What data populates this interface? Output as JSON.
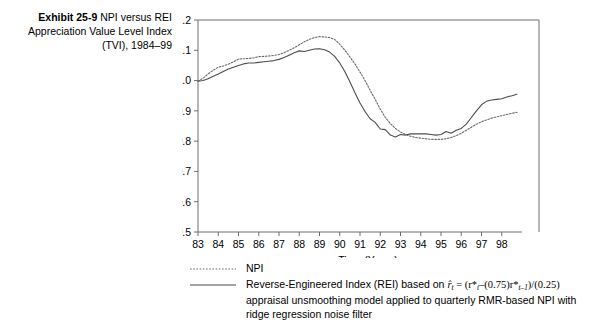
{
  "caption": {
    "exhibit_number": "Exhibit 25-9",
    "text": "NPI versus REI Appreciation Value Level Index (TVI), 1984–99"
  },
  "legend": {
    "items": [
      {
        "style": "dotted",
        "label": "NPI"
      },
      {
        "style": "solid",
        "label": "Reverse-Engineered Index (REI) based on r̂t = (r*t–(0.75)r*t–1)/(0.25) appraisal unsmoothing model applied to quarterly RMR-based NPI with ridge regression noise filter",
        "label_line1_a": "Reverse-Engineered Index (REI) based on ",
        "label_formula": "r̂",
        "label_formula_sub1": "t",
        "label_formula_b": " = (r*",
        "label_formula_sub2": "t",
        "label_formula_c": "–(0.75)r*",
        "label_formula_sub3": "t–1",
        "label_formula_d": ")/(0.25)",
        "label_line2": "appraisal unsmoothing model applied to quarterly RMR-based NPI with",
        "label_line3": "ridge regression noise filter"
      }
    ]
  },
  "chart_data": {
    "type": "line",
    "title": "NPI versus REI Appreciation Value Level Index (TVI), 1984–99",
    "xlabel": "Time (Years)",
    "ylabel": "Index Value Level",
    "xlim": [
      83,
      99
    ],
    "ylim": [
      0.5,
      1.2
    ],
    "ytick_labels": [
      "0.5",
      "0.6",
      "0.7",
      "0.8",
      "0.9",
      "1.0",
      "1.1",
      "1.2"
    ],
    "yticks": [
      0.5,
      0.6,
      0.7,
      0.8,
      0.9,
      1.0,
      1.1,
      1.2
    ],
    "xtick_labels": [
      "83",
      "84",
      "85",
      "86",
      "87",
      "88",
      "89",
      "90",
      "91",
      "92",
      "93",
      "94",
      "95",
      "96",
      "97",
      "98"
    ],
    "xticks": [
      83,
      84,
      85,
      86,
      87,
      88,
      89,
      90,
      91,
      92,
      93,
      94,
      95,
      96,
      97,
      98
    ],
    "grid": false,
    "legend_position": "below",
    "series": [
      {
        "name": "NPI",
        "style": "dotted",
        "color": "#6b6b6b",
        "x": [
          83.0,
          83.25,
          83.5,
          83.75,
          84.0,
          84.25,
          84.5,
          84.75,
          85.0,
          85.25,
          85.5,
          85.75,
          86.0,
          86.25,
          86.5,
          86.75,
          87.0,
          87.25,
          87.5,
          87.75,
          88.0,
          88.25,
          88.5,
          88.75,
          89.0,
          89.25,
          89.5,
          89.75,
          90.0,
          90.25,
          90.5,
          90.75,
          91.0,
          91.25,
          91.5,
          91.75,
          92.0,
          92.25,
          92.5,
          92.75,
          93.0,
          93.25,
          93.5,
          93.75,
          94.0,
          94.25,
          94.5,
          94.75,
          95.0,
          95.25,
          95.5,
          95.75,
          96.0,
          96.25,
          96.5,
          96.75,
          97.0,
          97.25,
          97.5,
          97.75,
          98.0,
          98.25,
          98.5,
          98.75
        ],
        "y": [
          0.998,
          1.008,
          1.022,
          1.034,
          1.044,
          1.048,
          1.054,
          1.062,
          1.071,
          1.072,
          1.073,
          1.075,
          1.079,
          1.08,
          1.081,
          1.083,
          1.086,
          1.092,
          1.1,
          1.108,
          1.118,
          1.128,
          1.136,
          1.142,
          1.145,
          1.144,
          1.142,
          1.136,
          1.12,
          1.1,
          1.078,
          1.055,
          1.028,
          1.0,
          0.968,
          0.938,
          0.906,
          0.878,
          0.858,
          0.842,
          0.83,
          0.822,
          0.816,
          0.812,
          0.81,
          0.808,
          0.806,
          0.806,
          0.806,
          0.808,
          0.812,
          0.818,
          0.826,
          0.836,
          0.846,
          0.856,
          0.864,
          0.87,
          0.876,
          0.88,
          0.884,
          0.888,
          0.892,
          0.895
        ]
      },
      {
        "name": "REI",
        "style": "solid",
        "color": "#4d4d4d",
        "x": [
          83.0,
          83.25,
          83.5,
          83.75,
          84.0,
          84.25,
          84.5,
          84.75,
          85.0,
          85.25,
          85.5,
          85.75,
          86.0,
          86.25,
          86.5,
          86.75,
          87.0,
          87.25,
          87.5,
          87.75,
          88.0,
          88.25,
          88.5,
          88.75,
          89.0,
          89.25,
          89.5,
          89.75,
          90.0,
          90.25,
          90.5,
          90.75,
          91.0,
          91.25,
          91.5,
          91.75,
          92.0,
          92.25,
          92.5,
          92.75,
          93.0,
          93.25,
          93.5,
          93.75,
          94.0,
          94.25,
          94.5,
          94.75,
          95.0,
          95.25,
          95.5,
          95.75,
          96.0,
          96.25,
          96.5,
          96.75,
          97.0,
          97.25,
          97.5,
          97.75,
          98.0,
          98.25,
          98.5,
          98.75
        ],
        "y": [
          0.998,
          1.0,
          1.006,
          1.014,
          1.022,
          1.03,
          1.038,
          1.044,
          1.05,
          1.055,
          1.058,
          1.058,
          1.06,
          1.062,
          1.064,
          1.066,
          1.07,
          1.076,
          1.084,
          1.092,
          1.098,
          1.096,
          1.1,
          1.104,
          1.105,
          1.102,
          1.094,
          1.08,
          1.058,
          1.03,
          0.996,
          0.96,
          0.926,
          0.898,
          0.874,
          0.862,
          0.84,
          0.838,
          0.82,
          0.814,
          0.822,
          0.82,
          0.824,
          0.824,
          0.824,
          0.824,
          0.822,
          0.82,
          0.822,
          0.832,
          0.826,
          0.836,
          0.842,
          0.856,
          0.878,
          0.9,
          0.92,
          0.932,
          0.936,
          0.938,
          0.94,
          0.946,
          0.95,
          0.955
        ]
      }
    ]
  }
}
